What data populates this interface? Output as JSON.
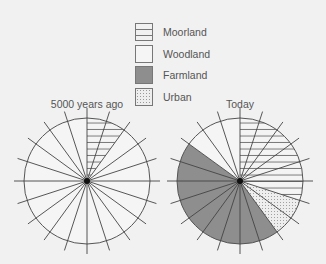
{
  "chart_data": {
    "type": "pie",
    "charts": [
      {
        "title": "5000 years ago",
        "segments_total": 20,
        "slices": [
          {
            "label": "Moorland",
            "value": 10
          },
          {
            "label": "Woodland",
            "value": 90
          }
        ]
      },
      {
        "title": "Today",
        "segments_total": 20,
        "slices": [
          {
            "label": "Moorland",
            "value": 30
          },
          {
            "label": "Urban",
            "value": 10
          },
          {
            "label": "Farmland",
            "value": 45
          },
          {
            "label": "Woodland",
            "value": 15
          }
        ]
      }
    ],
    "legend": [
      {
        "label": "Moorland",
        "pattern": "horizontal-lines"
      },
      {
        "label": "Woodland",
        "pattern": "blank"
      },
      {
        "label": "Farmland",
        "pattern": "grey-fill",
        "color": "#8e8e8e"
      },
      {
        "label": "Urban",
        "pattern": "dots"
      }
    ],
    "legend_position": "top-center"
  },
  "legend": {
    "moorland": "Moorland",
    "woodland": "Woodland",
    "farmland": "Farmland",
    "urban": "Urban"
  },
  "titles": {
    "left": "5000 years ago",
    "right": "Today"
  }
}
